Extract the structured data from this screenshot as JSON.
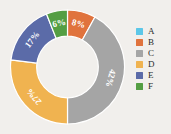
{
  "chart_data": {
    "type": "pie",
    "variant": "doughnut",
    "title": "",
    "subtitle": "",
    "xlabel": "",
    "ylabel": "",
    "categories": [
      "A",
      "B",
      "C",
      "D",
      "E",
      "F"
    ],
    "values": [
      0,
      8,
      42,
      27,
      17,
      6
    ],
    "value_labels": [
      "",
      "8%",
      "42%",
      "27%",
      "17%",
      "6%"
    ],
    "visible_slices": [
      {
        "category": "B",
        "value": 8,
        "label": "8%",
        "color": "#e0733d"
      },
      {
        "category": "C",
        "value": 42,
        "label": "42%",
        "color": "#a5a5a5"
      },
      {
        "category": "D",
        "value": 27,
        "label": "27%",
        "color": "#f0b350"
      },
      {
        "category": "E",
        "value": 17,
        "label": "17%",
        "color": "#5b6ba8"
      },
      {
        "category": "F",
        "value": 6,
        "label": "6%",
        "color": "#549e43"
      }
    ],
    "colors": [
      "#5cc7e8",
      "#e0733d",
      "#a5a5a5",
      "#f0b350",
      "#5b6ba8",
      "#549e43"
    ],
    "legend_position": "right",
    "grid": false,
    "background_color": "#f1efec",
    "label_color": "#ffffff",
    "hole_ratio": 0.54,
    "start_angle_deg": 0
  },
  "legend": {
    "items": [
      {
        "label": "A",
        "color": "#5cc7e8"
      },
      {
        "label": "B",
        "color": "#e0733d"
      },
      {
        "label": "C",
        "color": "#a5a5a5"
      },
      {
        "label": "D",
        "color": "#f0b350"
      },
      {
        "label": "E",
        "color": "#5b6ba8"
      },
      {
        "label": "F",
        "color": "#549e43"
      }
    ]
  },
  "slice_labels": {
    "b": "8%",
    "c": "42%",
    "d": "27%",
    "e": "17%",
    "f": "6%"
  }
}
